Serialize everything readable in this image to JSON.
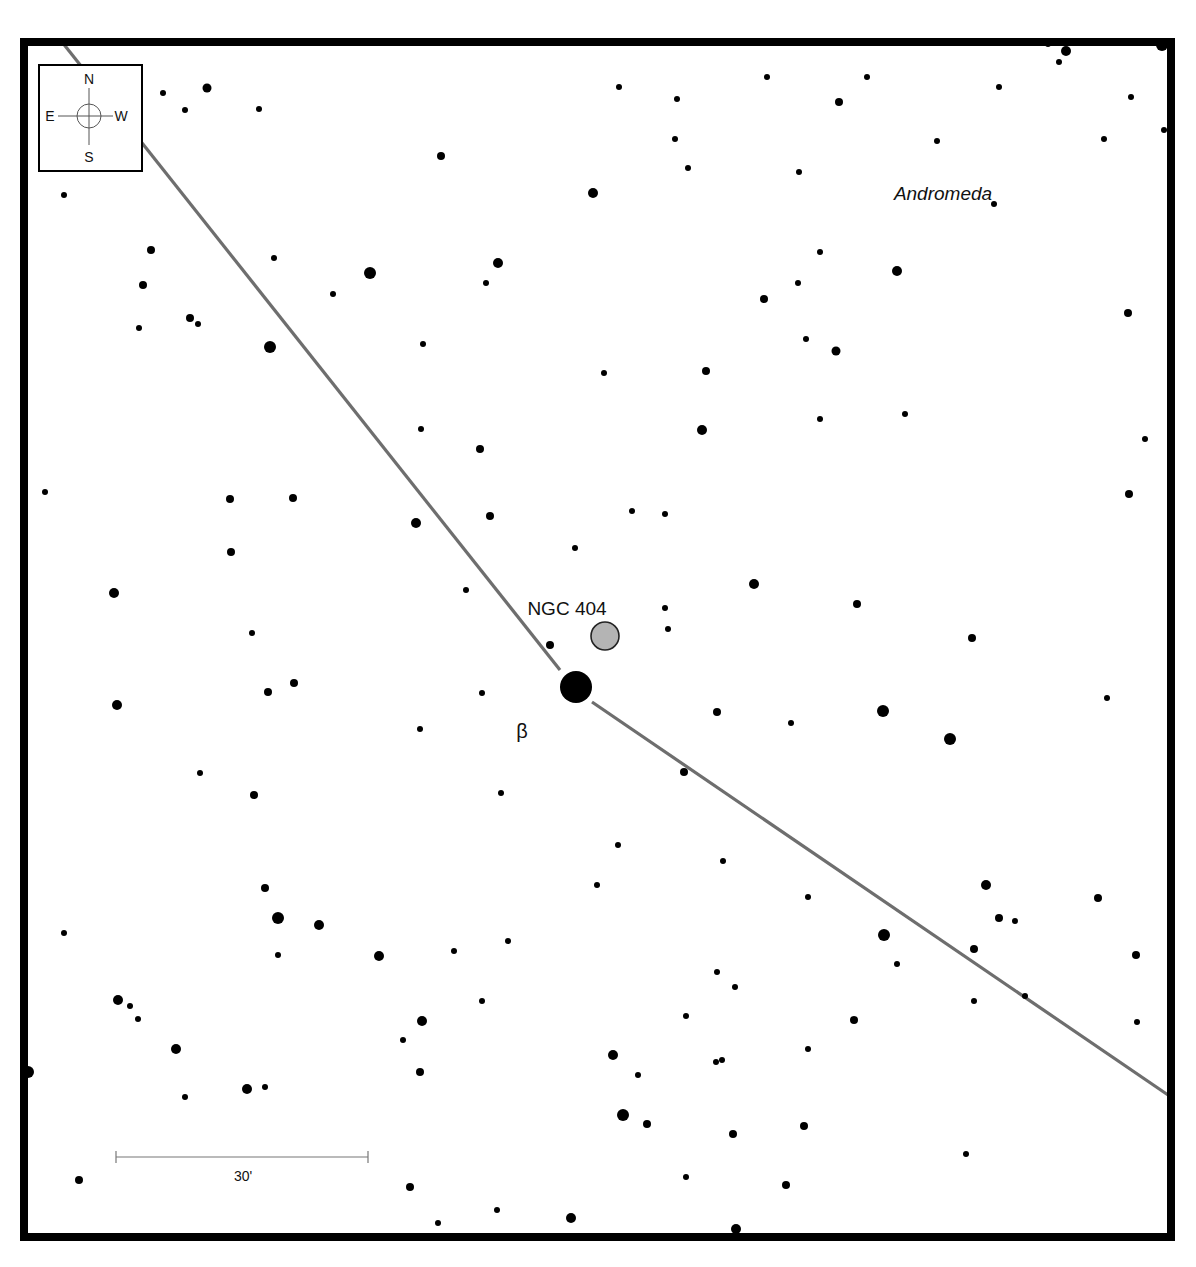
{
  "chart_data": {
    "type": "scatter",
    "constellation_label": "Andromeda",
    "target": {
      "label": "NGC 404",
      "x": 605,
      "y": 636,
      "r": 14,
      "fill": "#b4b4b4"
    },
    "bright_star": {
      "label": "β",
      "x": 576,
      "y": 687,
      "r": 16
    },
    "labels": {
      "target_label": {
        "text": "NGC 404",
        "x": 567,
        "y": 615
      },
      "beta_label": {
        "text": "β",
        "x": 522,
        "y": 738
      },
      "constellation": {
        "text": "Andromeda",
        "x": 943,
        "y": 200
      }
    },
    "compass": {
      "N": "N",
      "S": "S",
      "E": "E",
      "W": "W"
    },
    "scale_bar": {
      "label": "30'",
      "x1": 116,
      "x2": 368,
      "y": 1157
    },
    "frame": {
      "x": 24,
      "y": 42,
      "width": 1147,
      "height": 1195
    },
    "path_segments": [
      {
        "x1": 62,
        "y1": 42,
        "x2": 560,
        "y2": 670
      },
      {
        "x1": 592,
        "y1": 702,
        "x2": 1171,
        "y2": 1097
      }
    ],
    "stars": [
      {
        "x": 163,
        "y": 93,
        "r": 3
      },
      {
        "x": 185,
        "y": 110,
        "r": 3
      },
      {
        "x": 207,
        "y": 88,
        "r": 4.5
      },
      {
        "x": 259,
        "y": 109,
        "r": 3
      },
      {
        "x": 441,
        "y": 156,
        "r": 4
      },
      {
        "x": 593,
        "y": 193,
        "r": 5
      },
      {
        "x": 619,
        "y": 87,
        "r": 3
      },
      {
        "x": 677,
        "y": 99,
        "r": 3
      },
      {
        "x": 675,
        "y": 139,
        "r": 3
      },
      {
        "x": 688,
        "y": 168,
        "r": 3
      },
      {
        "x": 767,
        "y": 77,
        "r": 3
      },
      {
        "x": 839,
        "y": 102,
        "r": 4
      },
      {
        "x": 867,
        "y": 77,
        "r": 3
      },
      {
        "x": 937,
        "y": 141,
        "r": 3
      },
      {
        "x": 999,
        "y": 87,
        "r": 3
      },
      {
        "x": 994,
        "y": 204,
        "r": 3
      },
      {
        "x": 1059,
        "y": 62,
        "r": 3
      },
      {
        "x": 1066,
        "y": 51,
        "r": 5
      },
      {
        "x": 1104,
        "y": 139,
        "r": 3
      },
      {
        "x": 1131,
        "y": 97,
        "r": 3
      },
      {
        "x": 1164,
        "y": 130,
        "r": 3
      },
      {
        "x": 1162,
        "y": 45,
        "r": 6
      },
      {
        "x": 1048,
        "y": 44,
        "r": 3
      },
      {
        "x": 64,
        "y": 195,
        "r": 3
      },
      {
        "x": 151,
        "y": 250,
        "r": 4
      },
      {
        "x": 143,
        "y": 285,
        "r": 4
      },
      {
        "x": 139,
        "y": 328,
        "r": 3
      },
      {
        "x": 190,
        "y": 318,
        "r": 4
      },
      {
        "x": 198,
        "y": 324,
        "r": 3
      },
      {
        "x": 274,
        "y": 258,
        "r": 3
      },
      {
        "x": 370,
        "y": 273,
        "r": 6
      },
      {
        "x": 333,
        "y": 294,
        "r": 3
      },
      {
        "x": 498,
        "y": 263,
        "r": 5
      },
      {
        "x": 486,
        "y": 283,
        "r": 3
      },
      {
        "x": 270,
        "y": 347,
        "r": 6
      },
      {
        "x": 423,
        "y": 344,
        "r": 3
      },
      {
        "x": 799,
        "y": 172,
        "r": 3
      },
      {
        "x": 820,
        "y": 252,
        "r": 3
      },
      {
        "x": 798,
        "y": 283,
        "r": 3
      },
      {
        "x": 764,
        "y": 299,
        "r": 4
      },
      {
        "x": 897,
        "y": 271,
        "r": 5
      },
      {
        "x": 806,
        "y": 339,
        "r": 3
      },
      {
        "x": 836,
        "y": 351,
        "r": 4.5
      },
      {
        "x": 604,
        "y": 373,
        "r": 3
      },
      {
        "x": 706,
        "y": 371,
        "r": 4
      },
      {
        "x": 1128,
        "y": 313,
        "r": 4
      },
      {
        "x": 421,
        "y": 429,
        "r": 3
      },
      {
        "x": 480,
        "y": 449,
        "r": 4
      },
      {
        "x": 702,
        "y": 430,
        "r": 5
      },
      {
        "x": 820,
        "y": 419,
        "r": 3
      },
      {
        "x": 905,
        "y": 414,
        "r": 3
      },
      {
        "x": 1145,
        "y": 439,
        "r": 3
      },
      {
        "x": 45,
        "y": 492,
        "r": 3
      },
      {
        "x": 230,
        "y": 499,
        "r": 4
      },
      {
        "x": 293,
        "y": 498,
        "r": 4
      },
      {
        "x": 416,
        "y": 523,
        "r": 5
      },
      {
        "x": 490,
        "y": 516,
        "r": 4
      },
      {
        "x": 632,
        "y": 511,
        "r": 3
      },
      {
        "x": 665,
        "y": 514,
        "r": 3
      },
      {
        "x": 231,
        "y": 552,
        "r": 4
      },
      {
        "x": 575,
        "y": 548,
        "r": 3
      },
      {
        "x": 1129,
        "y": 494,
        "r": 4
      },
      {
        "x": 1170,
        "y": 508,
        "r": 3
      },
      {
        "x": 114,
        "y": 593,
        "r": 5
      },
      {
        "x": 466,
        "y": 590,
        "r": 3
      },
      {
        "x": 754,
        "y": 584,
        "r": 5
      },
      {
        "x": 665,
        "y": 608,
        "r": 3
      },
      {
        "x": 668,
        "y": 629,
        "r": 3
      },
      {
        "x": 857,
        "y": 604,
        "r": 4
      },
      {
        "x": 252,
        "y": 633,
        "r": 3
      },
      {
        "x": 550,
        "y": 645,
        "r": 4
      },
      {
        "x": 972,
        "y": 638,
        "r": 4
      },
      {
        "x": 268,
        "y": 692,
        "r": 4
      },
      {
        "x": 294,
        "y": 683,
        "r": 4
      },
      {
        "x": 482,
        "y": 693,
        "r": 3
      },
      {
        "x": 117,
        "y": 705,
        "r": 5
      },
      {
        "x": 420,
        "y": 729,
        "r": 3
      },
      {
        "x": 717,
        "y": 712,
        "r": 4
      },
      {
        "x": 791,
        "y": 723,
        "r": 3
      },
      {
        "x": 883,
        "y": 711,
        "r": 6
      },
      {
        "x": 950,
        "y": 739,
        "r": 6
      },
      {
        "x": 1107,
        "y": 698,
        "r": 3
      },
      {
        "x": 1170,
        "y": 760,
        "r": 3
      },
      {
        "x": 200,
        "y": 773,
        "r": 3
      },
      {
        "x": 684,
        "y": 772,
        "r": 4
      },
      {
        "x": 254,
        "y": 795,
        "r": 4
      },
      {
        "x": 501,
        "y": 793,
        "r": 3
      },
      {
        "x": 618,
        "y": 845,
        "r": 3
      },
      {
        "x": 723,
        "y": 861,
        "r": 3
      },
      {
        "x": 597,
        "y": 885,
        "r": 3
      },
      {
        "x": 265,
        "y": 888,
        "r": 4
      },
      {
        "x": 986,
        "y": 885,
        "r": 5
      },
      {
        "x": 808,
        "y": 897,
        "r": 3
      },
      {
        "x": 1098,
        "y": 898,
        "r": 4
      },
      {
        "x": 278,
        "y": 918,
        "r": 6
      },
      {
        "x": 319,
        "y": 925,
        "r": 5
      },
      {
        "x": 999,
        "y": 918,
        "r": 4
      },
      {
        "x": 1015,
        "y": 921,
        "r": 3
      },
      {
        "x": 884,
        "y": 935,
        "r": 6
      },
      {
        "x": 64,
        "y": 933,
        "r": 3
      },
      {
        "x": 508,
        "y": 941,
        "r": 3
      },
      {
        "x": 454,
        "y": 951,
        "r": 3
      },
      {
        "x": 278,
        "y": 955,
        "r": 3
      },
      {
        "x": 379,
        "y": 956,
        "r": 5
      },
      {
        "x": 974,
        "y": 949,
        "r": 4
      },
      {
        "x": 1136,
        "y": 955,
        "r": 4
      },
      {
        "x": 897,
        "y": 964,
        "r": 3
      },
      {
        "x": 717,
        "y": 972,
        "r": 3
      },
      {
        "x": 735,
        "y": 987,
        "r": 3
      },
      {
        "x": 1025,
        "y": 996,
        "r": 3
      },
      {
        "x": 118,
        "y": 1000,
        "r": 5
      },
      {
        "x": 130,
        "y": 1006,
        "r": 3
      },
      {
        "x": 138,
        "y": 1019,
        "r": 3
      },
      {
        "x": 482,
        "y": 1001,
        "r": 3
      },
      {
        "x": 974,
        "y": 1001,
        "r": 3
      },
      {
        "x": 686,
        "y": 1016,
        "r": 3
      },
      {
        "x": 422,
        "y": 1021,
        "r": 5
      },
      {
        "x": 854,
        "y": 1020,
        "r": 4
      },
      {
        "x": 1137,
        "y": 1022,
        "r": 3
      },
      {
        "x": 403,
        "y": 1040,
        "r": 3
      },
      {
        "x": 176,
        "y": 1049,
        "r": 5
      },
      {
        "x": 808,
        "y": 1049,
        "r": 3
      },
      {
        "x": 613,
        "y": 1055,
        "r": 5
      },
      {
        "x": 716,
        "y": 1062,
        "r": 3
      },
      {
        "x": 722,
        "y": 1060,
        "r": 3
      },
      {
        "x": 28,
        "y": 1072,
        "r": 6
      },
      {
        "x": 420,
        "y": 1072,
        "r": 4
      },
      {
        "x": 638,
        "y": 1075,
        "r": 3
      },
      {
        "x": 265,
        "y": 1087,
        "r": 3
      },
      {
        "x": 247,
        "y": 1089,
        "r": 5
      },
      {
        "x": 185,
        "y": 1097,
        "r": 3
      },
      {
        "x": 623,
        "y": 1115,
        "r": 6
      },
      {
        "x": 647,
        "y": 1124,
        "r": 4
      },
      {
        "x": 733,
        "y": 1134,
        "r": 4
      },
      {
        "x": 804,
        "y": 1126,
        "r": 4
      },
      {
        "x": 966,
        "y": 1154,
        "r": 3
      },
      {
        "x": 79,
        "y": 1180,
        "r": 4
      },
      {
        "x": 686,
        "y": 1177,
        "r": 3
      },
      {
        "x": 786,
        "y": 1185,
        "r": 4
      },
      {
        "x": 410,
        "y": 1187,
        "r": 4
      },
      {
        "x": 497,
        "y": 1210,
        "r": 3
      },
      {
        "x": 438,
        "y": 1223,
        "r": 3
      },
      {
        "x": 571,
        "y": 1218,
        "r": 5
      },
      {
        "x": 736,
        "y": 1229,
        "r": 5
      }
    ]
  }
}
